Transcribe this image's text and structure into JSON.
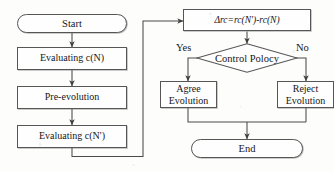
{
  "diagram": {
    "type": "flowchart",
    "nodes": {
      "start": {
        "label": "Start",
        "shape": "terminal"
      },
      "eval_n": {
        "label": "Evaluating c(N)",
        "shape": "process"
      },
      "pre_evo": {
        "label": "Pre-evolution",
        "shape": "process"
      },
      "eval_n_prime": {
        "label": "Evaluating c(N')",
        "shape": "process"
      },
      "delta_rc": {
        "label": "Δrc=rc(N')-rc(N)",
        "shape": "process"
      },
      "control": {
        "label": "Control Polocy",
        "shape": "decision"
      },
      "agree": {
        "line1": "Agree",
        "line2": "Evolution",
        "shape": "process"
      },
      "reject": {
        "line1": "Reject",
        "line2": "Evolution",
        "shape": "process"
      },
      "end": {
        "label": "End",
        "shape": "terminal"
      }
    },
    "edge_labels": {
      "yes": "Yes",
      "no": "No"
    },
    "colors": {
      "stroke": "#565656",
      "line": "#4a4a4a",
      "text": "#15161a",
      "background": "#fdfdfc",
      "node_fill": "#fefefe"
    }
  }
}
